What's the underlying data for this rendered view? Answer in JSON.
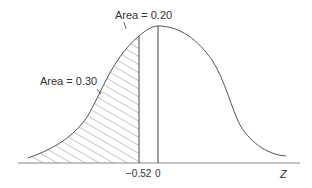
{
  "diagram": {
    "type": "standard-normal-curve",
    "annotations": {
      "left_area": "Area = 0.30",
      "middle_area": "Area = 0.20"
    },
    "ticks": {
      "z_cut": "−0.52",
      "zero": "0"
    },
    "axis_label": "Z",
    "colors": {
      "line": "#555555",
      "hatch": "#777777"
    }
  }
}
